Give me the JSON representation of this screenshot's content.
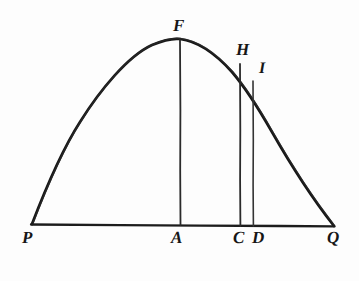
{
  "figure": {
    "kind": "geometry-diagram",
    "background_color": "#fdfdfd",
    "ink_color": "#161616",
    "stroke_width_curve": 2.6,
    "stroke_width_base": 2.2,
    "stroke_width_ordinate": 1.7,
    "labels": {
      "P": "P",
      "A": "A",
      "C": "C",
      "D": "D",
      "Q": "Q",
      "F": "F",
      "H": "H",
      "I": "I"
    },
    "points": {
      "P": {
        "x": 32,
        "y": 224
      },
      "Q": {
        "x": 334,
        "y": 226
      },
      "A": {
        "x": 180,
        "y": 225
      },
      "C": {
        "x": 240,
        "y": 226
      },
      "D": {
        "x": 253,
        "y": 226
      },
      "F": {
        "x": 180,
        "y": 39
      },
      "H": {
        "x": 240,
        "y": 64
      },
      "I": {
        "x": 253,
        "y": 81
      }
    },
    "segments": [
      {
        "name": "base-line-PQ",
        "from": "P",
        "to": "Q"
      },
      {
        "name": "ordinate-FA",
        "from": "F",
        "to": "A"
      },
      {
        "name": "ordinate-HC",
        "from": "H",
        "to": "C"
      },
      {
        "name": "ordinate-ID",
        "from": "I",
        "to": "D"
      }
    ],
    "curve": {
      "name": "parabolic-arc-PFQ",
      "through": [
        "P",
        "F",
        "Q"
      ],
      "apex": "F"
    }
  }
}
